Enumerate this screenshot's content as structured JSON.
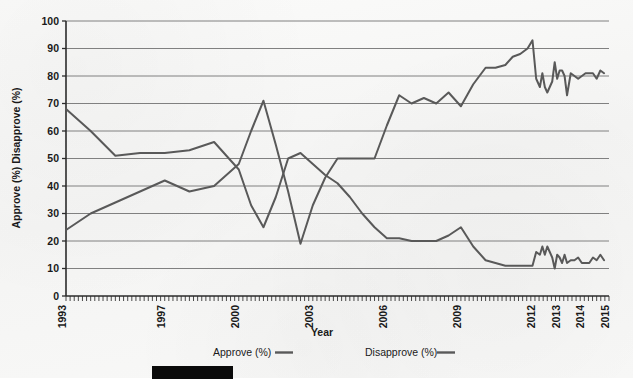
{
  "chart_data": {
    "type": "line",
    "title": "",
    "xlabel": "Year",
    "ylabel": "Approve (%) Disapprove (%)",
    "ylim": [
      0,
      100
    ],
    "ytick_values": [
      0,
      10,
      20,
      30,
      40,
      50,
      60,
      70,
      80,
      90,
      100
    ],
    "ytick_labels": [
      "0",
      "10",
      "20",
      "30",
      "40",
      "50",
      "60",
      "70",
      "80",
      "90",
      "100"
    ],
    "xlim": [
      1993,
      2015
    ],
    "xtick_labels": [
      "1993",
      "1997",
      "2000",
      "2003",
      "2006",
      "2009",
      "2012",
      "2013",
      "2014",
      "2015"
    ],
    "xtick_values": [
      1993,
      1997,
      2000,
      2003,
      2006,
      2009,
      2012,
      2013,
      2014,
      2015
    ],
    "minor_ticks": true,
    "grid": "horizontal",
    "legend_position": "bottom",
    "line_color": "#595959",
    "grid_color": "#808080",
    "axis_color": "#2b2b2b",
    "series": [
      {
        "name": "Approve (%)",
        "color": "#595959",
        "x": [
          1993,
          1994,
          1995,
          1996,
          1997,
          1998,
          1999,
          2000,
          2000.5,
          2001,
          2001.5,
          2002,
          2002.5,
          2003,
          2003.5,
          2004,
          2004.5,
          2005,
          2005.5,
          2006,
          2006.5,
          2007,
          2007.5,
          2008,
          2008.5,
          2009,
          2009.5,
          2010,
          2010.4,
          2010.8,
          2011.1,
          2011.4,
          2011.7,
          2011.9,
          2012.05,
          2012.2,
          2012.3,
          2012.4,
          2012.5,
          2012.6,
          2012.7,
          2012.8,
          2012.9,
          2013.0,
          2013.1,
          2013.2,
          2013.3,
          2013.45,
          2013.6,
          2013.75,
          2013.9,
          2014.05,
          2014.2,
          2014.35,
          2014.5,
          2014.65,
          2014.8
        ],
        "values": [
          24,
          30,
          34,
          38,
          42,
          38,
          40,
          48,
          60,
          71,
          55,
          38,
          19,
          33,
          43,
          50,
          50,
          50,
          50,
          62,
          73,
          70,
          72,
          70,
          74,
          69,
          77,
          83,
          83,
          84,
          87,
          88,
          90,
          93,
          79,
          76,
          81,
          76,
          74,
          76,
          78,
          85,
          79,
          82,
          82,
          80,
          73,
          81,
          80,
          79,
          80,
          81,
          81,
          81,
          79,
          82,
          81
        ]
      },
      {
        "name": "Disapprove (%)",
        "color": "#595959",
        "x": [
          1993,
          1994,
          1995,
          1996,
          1997,
          1998,
          1999,
          2000,
          2000.5,
          2001,
          2001.5,
          2002,
          2002.5,
          2003,
          2003.5,
          2004,
          2004.5,
          2005,
          2005.5,
          2006,
          2006.5,
          2007,
          2007.5,
          2008,
          2008.5,
          2009,
          2009.5,
          2010,
          2010.4,
          2010.8,
          2011.1,
          2011.4,
          2011.7,
          2011.9,
          2012.05,
          2012.2,
          2012.3,
          2012.4,
          2012.5,
          2012.6,
          2012.7,
          2012.8,
          2012.9,
          2013.0,
          2013.1,
          2013.2,
          2013.3,
          2013.45,
          2013.6,
          2013.75,
          2013.9,
          2014.05,
          2014.2,
          2014.35,
          2014.5,
          2014.65,
          2014.8
        ],
        "values": [
          68,
          60,
          51,
          52,
          52,
          53,
          56,
          46,
          33,
          25,
          36,
          50,
          52,
          48,
          44,
          41,
          36,
          30,
          25,
          21,
          21,
          20,
          20,
          20,
          22,
          25,
          18,
          13,
          12,
          11,
          11,
          11,
          11,
          11,
          16,
          15,
          18,
          15,
          18,
          16,
          14,
          10,
          15,
          14,
          12,
          15,
          12,
          13,
          13,
          14,
          12,
          12,
          12,
          14,
          13,
          15,
          13
        ]
      }
    ],
    "legend": [
      {
        "label": "Approve (%)",
        "swatch": "line"
      },
      {
        "label": "Disapprove (%)",
        "swatch": "line"
      }
    ]
  },
  "footer": {
    "redaction_present": true
  }
}
